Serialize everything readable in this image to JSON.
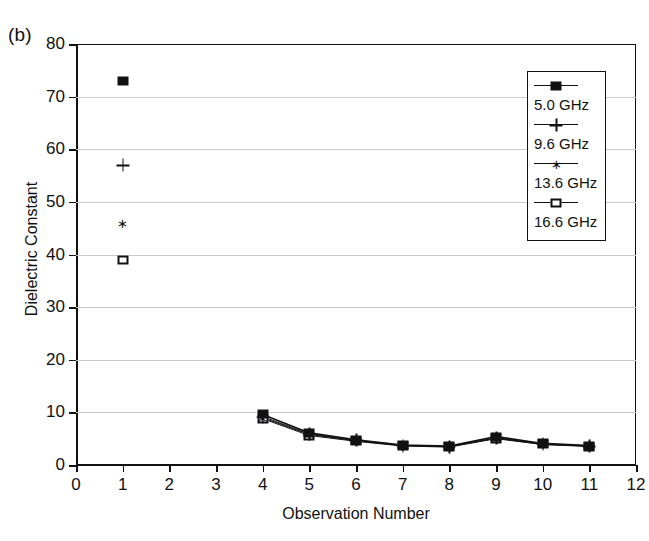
{
  "figure": {
    "panel_label": "(b)",
    "xlabel": "Observation Number",
    "ylabel": "Dielectric Constant"
  },
  "legend": {
    "position": "upper-right",
    "entries": [
      {
        "label": "5.0 GHz",
        "marker": "filled-square"
      },
      {
        "label": "9.6 GHz",
        "marker": "plus"
      },
      {
        "label": "13.6 GHz",
        "marker": "asterisk"
      },
      {
        "label": "16.6 GHz",
        "marker": "open-square"
      }
    ]
  },
  "axes": {
    "x_ticks": [
      "0",
      "1",
      "2",
      "3",
      "4",
      "5",
      "6",
      "7",
      "8",
      "9",
      "10",
      "11",
      "12"
    ],
    "y_ticks": [
      "0",
      "10",
      "20",
      "30",
      "40",
      "50",
      "60",
      "70",
      "80"
    ]
  },
  "chart_data": {
    "type": "scatter",
    "title": "(b)",
    "xlabel": "Observation Number",
    "ylabel": "Dielectric Constant",
    "xlim": [
      0,
      12
    ],
    "ylim": [
      0,
      80
    ],
    "xticks": [
      0,
      1,
      2,
      3,
      4,
      5,
      6,
      7,
      8,
      9,
      10,
      11,
      12
    ],
    "yticks": [
      0,
      10,
      20,
      30,
      40,
      50,
      60,
      70,
      80
    ],
    "grid": "horizontal",
    "legend_position": "upper right",
    "series": [
      {
        "name": "5.0 GHz",
        "marker": "filled-square",
        "x": [
          1,
          4,
          5,
          6,
          7,
          8,
          9,
          10,
          11
        ],
        "y": [
          73,
          9.6,
          6.1,
          4.8,
          3.8,
          3.6,
          5.4,
          4.1,
          3.7
        ],
        "connected": true
      },
      {
        "name": "9.6 GHz",
        "marker": "plus",
        "x": [
          1,
          4,
          5,
          6,
          7,
          8,
          9,
          10,
          11
        ],
        "y": [
          57,
          9.2,
          5.9,
          4.7,
          3.7,
          3.5,
          5.2,
          4.0,
          3.6
        ],
        "connected": true
      },
      {
        "name": "13.6 GHz",
        "marker": "asterisk",
        "x": [
          1,
          4,
          5,
          6,
          7,
          8,
          9,
          10,
          11
        ],
        "y": [
          46,
          9.0,
          5.8,
          4.6,
          3.7,
          3.5,
          5.1,
          3.9,
          3.6
        ],
        "connected": true
      },
      {
        "name": "16.6 GHz",
        "marker": "open-square",
        "x": [
          1,
          4,
          5,
          6,
          7,
          8,
          9,
          10,
          11
        ],
        "y": [
          39,
          8.8,
          5.6,
          4.5,
          3.6,
          3.4,
          5.0,
          3.9,
          3.5
        ],
        "connected": true
      }
    ]
  }
}
